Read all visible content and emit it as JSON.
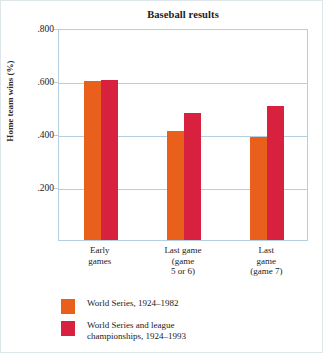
{
  "chart_data": {
    "type": "bar",
    "title": "Baseball results",
    "xlabel": "",
    "ylabel": "Home team wins (%)",
    "ylim": [
      0,
      0.8
    ],
    "grid": true,
    "legend_position": "below",
    "categories": [
      {
        "lines": [
          "Early",
          "games"
        ]
      },
      {
        "lines": [
          "Last game",
          "(game",
          "5 or 6)"
        ]
      },
      {
        "lines": [
          "Last",
          "game",
          "(game 7)"
        ]
      }
    ],
    "ticks": [
      {
        "label": ".800",
        "value": 0.8
      },
      {
        "label": ".600",
        "value": 0.6
      },
      {
        "label": ".400",
        "value": 0.4
      },
      {
        "label": ".200",
        "value": 0.2
      }
    ],
    "series": [
      {
        "name": "World Series, 1924–1982",
        "color": "#E8601C",
        "values": [
          0.6,
          0.41,
          0.39
        ]
      },
      {
        "name": "World Series and league championships, 1924–1993",
        "color": "#D8203F",
        "values": [
          0.605,
          0.48,
          0.505
        ]
      }
    ]
  },
  "legend": {
    "items": [
      {
        "label": "World Series, 1924–1982",
        "color": "#E8601C"
      },
      {
        "label": "World Series and league\nchampionships, 1924–1993",
        "color": "#D8203F"
      }
    ]
  },
  "colors": {
    "series_orange": "#E8601C",
    "series_red": "#D8203F",
    "gridline": "#B6CFE0",
    "frame": "#B6CFE0",
    "text": "#1B1B1B"
  }
}
